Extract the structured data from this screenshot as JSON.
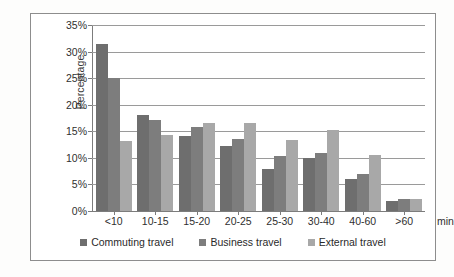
{
  "chart_data": {
    "type": "bar",
    "title": "",
    "xlabel": "min",
    "ylabel": "Percentage",
    "ylim": [
      0,
      35
    ],
    "ytick_step": 5,
    "ytick_labels": [
      "0%",
      "5%",
      "10%",
      "15%",
      "20%",
      "25%",
      "30%",
      "35%"
    ],
    "ytick_values": [
      0,
      5,
      10,
      15,
      20,
      25,
      30,
      35
    ],
    "grid": true,
    "legend_position": "bottom",
    "categories": [
      "<10",
      "10-15",
      "15-20",
      "20-25",
      "25-30",
      "30-40",
      "40-60",
      ">60"
    ],
    "series": [
      {
        "name": "Commuting travel",
        "color": "#6e6e6e",
        "values": [
          31.5,
          18.0,
          14.1,
          12.3,
          7.9,
          9.9,
          6.0,
          1.9
        ]
      },
      {
        "name": "Business travel",
        "color": "#7d7d7d",
        "values": [
          25.0,
          17.1,
          15.8,
          13.5,
          10.4,
          11.0,
          7.0,
          2.2
        ]
      },
      {
        "name": "External travel",
        "color": "#a8a8a8",
        "values": [
          13.1,
          14.3,
          16.6,
          16.6,
          13.4,
          15.3,
          10.5,
          2.3
        ]
      }
    ]
  },
  "axis": {
    "unit_label": "min"
  },
  "style": {
    "frame_border": "#8d8d8d",
    "grid_color": "#9a9a9a",
    "axis_color": "#7c7c7c",
    "text_color": "#2f2f2f",
    "background": "#ffffff"
  }
}
